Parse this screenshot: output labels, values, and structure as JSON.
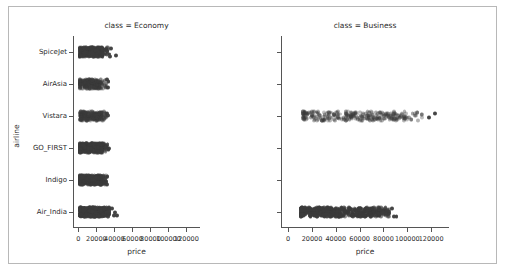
{
  "figure": {
    "width": 505,
    "height": 272,
    "background": "#ffffff",
    "border_color": "#b8b8b8",
    "marker_color": "#3b3b3b",
    "spine_color": "#555555",
    "text_color": "#2b2b2b"
  },
  "chart_data": {
    "type": "scatter",
    "plot_kind": "strip",
    "title": "",
    "xlabel": "price",
    "ylabel": "airline",
    "xlim": [
      -6000,
      135000
    ],
    "xticks": [
      0,
      20000,
      40000,
      60000,
      80000,
      100000,
      120000
    ],
    "xticklabels": [
      "0",
      "20000",
      "40000",
      "60000",
      "80000",
      "100000",
      "120000"
    ],
    "categories": [
      "SpiceJet",
      "AirAsia",
      "Vistara",
      "GO_FIRST",
      "Indigo",
      "Air_India"
    ],
    "grid": false,
    "legend": null,
    "facet_col": "class",
    "facets": [
      {
        "name": "economy",
        "title": "class = Economy",
        "series": [
          {
            "airline": "SpiceJet",
            "density": "high",
            "x_min": 1100,
            "x_max": 33000,
            "core_min": 3000,
            "core_max": 27000,
            "outliers": [
              34500,
              35200,
              36000,
              41500
            ]
          },
          {
            "airline": "AirAsia",
            "density": "medium",
            "x_min": 1100,
            "x_max": 31500,
            "core_min": 2500,
            "core_max": 26000,
            "outliers": [
              32000,
              32800,
              33500
            ]
          },
          {
            "airline": "Vistara",
            "density": "medium",
            "x_min": 1700,
            "x_max": 31000,
            "core_min": 3500,
            "core_max": 26500,
            "outliers": [
              31800,
              32500
            ]
          },
          {
            "airline": "GO_FIRST",
            "density": "high",
            "x_min": 1100,
            "x_max": 32500,
            "core_min": 2800,
            "core_max": 27000,
            "outliers": [
              33500,
              34200
            ]
          },
          {
            "airline": "Indigo",
            "density": "high",
            "x_min": 1100,
            "x_max": 31000,
            "core_min": 2200,
            "core_max": 26000,
            "outliers": [
              31500,
              32200
            ]
          },
          {
            "airline": "Air_India",
            "density": "very-high",
            "x_min": 1500,
            "x_max": 35000,
            "core_min": 3000,
            "core_max": 30000,
            "outliers": [
              37500,
              39500,
              41000,
              42500
            ]
          }
        ]
      },
      {
        "name": "business",
        "title": "class = Business",
        "series": [
          {
            "airline": "SpiceJet",
            "density": "none",
            "x_min": null,
            "x_max": null,
            "core_min": null,
            "core_max": null,
            "outliers": []
          },
          {
            "airline": "AirAsia",
            "density": "none",
            "x_min": null,
            "x_max": null,
            "core_min": null,
            "core_max": null,
            "outliers": []
          },
          {
            "airline": "Vistara",
            "density": "medium",
            "x_min": 12000,
            "x_max": 113000,
            "core_min": 14000,
            "core_max": 100000,
            "outliers": [
              118000,
              123000
            ]
          },
          {
            "airline": "GO_FIRST",
            "density": "none",
            "x_min": null,
            "x_max": null,
            "core_min": null,
            "core_max": null,
            "outliers": []
          },
          {
            "airline": "Indigo",
            "density": "none",
            "x_min": null,
            "x_max": null,
            "core_min": null,
            "core_max": null,
            "outliers": []
          },
          {
            "airline": "Air_India",
            "density": "very-high",
            "x_min": 10500,
            "x_max": 85000,
            "core_min": 12000,
            "core_max": 80000,
            "outliers": [
              87000,
              89000,
              91000
            ]
          }
        ]
      }
    ]
  }
}
